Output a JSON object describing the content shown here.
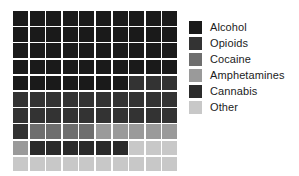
{
  "chart_data": {
    "type": "waffle",
    "title": "",
    "subtitle": "",
    "xlabel": "",
    "ylabel": "",
    "grid_rows": 10,
    "grid_cols": 10,
    "total_cells": 100,
    "cell_unit": "1 square = 1%",
    "legend_position": "right",
    "grid": "off",
    "categories": [
      "Alcohol",
      "Opioids",
      "Cocaine",
      "Amphetamines",
      "Cannabis",
      "Other"
    ],
    "values": [
      47,
      24,
      4,
      6,
      6,
      13
    ],
    "colors": [
      "#1a1a1a",
      "#333333",
      "#6e6e6e",
      "#9a9a9a",
      "#2b2b2b",
      "#c8c8c8"
    ],
    "cells": [
      [
        0,
        0,
        0,
        0,
        0,
        0,
        0,
        0,
        0,
        0
      ],
      [
        0,
        0,
        0,
        0,
        0,
        0,
        0,
        0,
        0,
        0
      ],
      [
        0,
        0,
        0,
        0,
        0,
        0,
        0,
        0,
        0,
        0
      ],
      [
        0,
        0,
        0,
        0,
        0,
        0,
        0,
        0,
        0,
        0
      ],
      [
        0,
        0,
        0,
        0,
        0,
        0,
        0,
        1,
        1,
        1
      ],
      [
        1,
        1,
        1,
        1,
        1,
        1,
        1,
        1,
        1,
        1
      ],
      [
        1,
        1,
        1,
        1,
        1,
        1,
        1,
        1,
        1,
        1
      ],
      [
        1,
        2,
        2,
        2,
        2,
        3,
        3,
        3,
        3,
        3
      ],
      [
        3,
        4,
        4,
        4,
        4,
        4,
        4,
        5,
        5,
        5
      ],
      [
        5,
        5,
        5,
        5,
        5,
        5,
        5,
        5,
        5,
        5
      ]
    ]
  },
  "legend": {
    "items": [
      {
        "label": "Alcohol",
        "color": "#1a1a1a"
      },
      {
        "label": "Opioids",
        "color": "#333333"
      },
      {
        "label": "Cocaine",
        "color": "#6e6e6e"
      },
      {
        "label": "Amphetamines",
        "color": "#9a9a9a"
      },
      {
        "label": "Cannabis",
        "color": "#2b2b2b"
      },
      {
        "label": "Other",
        "color": "#c8c8c8"
      }
    ]
  }
}
